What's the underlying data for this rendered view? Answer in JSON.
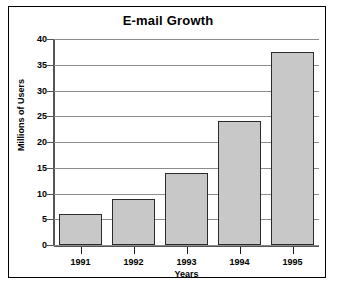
{
  "chart_data": {
    "type": "bar",
    "title": "E-mail Growth",
    "xlabel": "Years",
    "ylabel": "Millions of Users",
    "categories": [
      "1991",
      "1992",
      "1993",
      "1994",
      "1995"
    ],
    "values": [
      6,
      9,
      14,
      24,
      37.5
    ],
    "ylim": [
      0,
      40
    ],
    "ytick_step": 5,
    "yticks": [
      0,
      5,
      10,
      15,
      20,
      25,
      30,
      35,
      40
    ],
    "ytick_labels": [
      "0",
      "5",
      "10",
      "15",
      "20",
      "25",
      "30",
      "35",
      "40"
    ],
    "grid": true,
    "grid_axis": "y",
    "legend": false,
    "series": [
      {
        "name": "E-mail users",
        "values": [
          6,
          9,
          14,
          24,
          37.5
        ]
      }
    ],
    "colors": {
      "bar_fill": "#c8c8c8",
      "bar_border": "#2b2b2b",
      "gridline": "#8c8c8c",
      "axis": "#555555",
      "text": "#000000",
      "background": "#ffffff",
      "frame_border": "#000000"
    }
  }
}
